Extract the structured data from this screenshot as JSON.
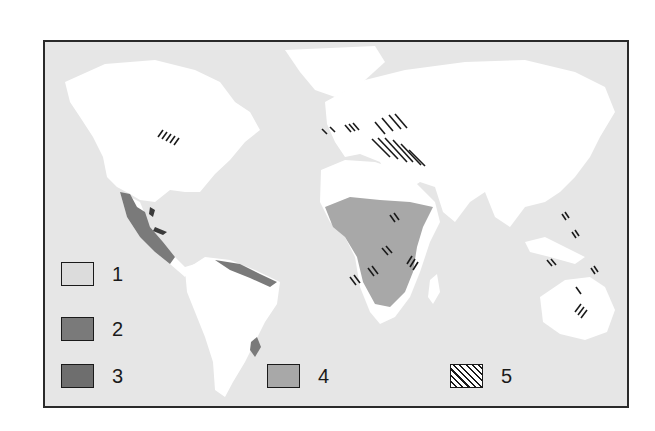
{
  "map": {
    "title": "",
    "type": "world distribution map",
    "colors": {
      "ocean": "#e6e6e6",
      "land_default": "#ffffff",
      "category_1": "#dcdcdc",
      "category_2": "#7a7a7a",
      "category_3": "#6e6e6e",
      "category_4": "#a8a8a8",
      "category_5_hatch": "#1a1a1a",
      "frame": "#2a2a2a"
    },
    "regions": [
      {
        "category": 2,
        "area": "Mexico / Central America Pacific coast"
      },
      {
        "category": 2,
        "area": "Northern South America coast"
      },
      {
        "category": 2,
        "area": "Southern Brazil patch"
      },
      {
        "category": 3,
        "area": "Caribbean islands"
      },
      {
        "category": 4,
        "area": "Sub-Saharan Africa"
      },
      {
        "category": 5,
        "area": "Eastern North America"
      },
      {
        "category": 5,
        "area": "Southern Europe"
      },
      {
        "category": 5,
        "area": "Eastern Europe / Central Asia"
      },
      {
        "category": 5,
        "area": "East Africa"
      },
      {
        "category": 5,
        "area": "Southern Africa"
      },
      {
        "category": 5,
        "area": "Madagascar"
      },
      {
        "category": 5,
        "area": "Philippines / Southeast Asia"
      },
      {
        "category": 5,
        "area": "Eastern Australia"
      }
    ]
  },
  "legend": {
    "items": [
      {
        "label": "1",
        "pattern": "light-gray"
      },
      {
        "label": "2",
        "pattern": "dark-gray"
      },
      {
        "label": "3",
        "pattern": "dark-gray"
      },
      {
        "label": "4",
        "pattern": "medium-gray"
      },
      {
        "label": "5",
        "pattern": "diagonal-hatch"
      }
    ]
  }
}
